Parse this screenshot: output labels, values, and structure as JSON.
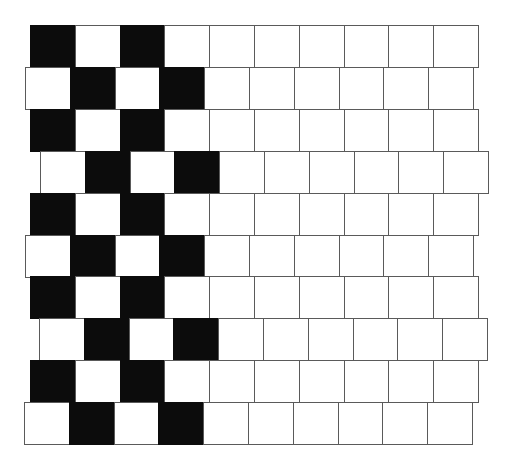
{
  "figure": {
    "name": "Cafe wall illusion pattern",
    "colors": {
      "background": "#ffffff",
      "dark": "#0c0c0c",
      "light": "#ffffff",
      "mortar": "#5a5a5a"
    },
    "cell_width": 44.8,
    "row_height": 41.9,
    "cells_per_row": 10,
    "rows": [
      {
        "y": 25,
        "x": 30,
        "black": [
          0,
          2
        ]
      },
      {
        "y": 67,
        "x": 25,
        "black": [
          1,
          3
        ]
      },
      {
        "y": 109,
        "x": 30,
        "black": [
          0,
          2
        ]
      },
      {
        "y": 151,
        "x": 40,
        "black": [
          1,
          3
        ]
      },
      {
        "y": 193,
        "x": 30,
        "black": [
          0,
          2
        ]
      },
      {
        "y": 235,
        "x": 25,
        "black": [
          1,
          3
        ]
      },
      {
        "y": 276,
        "x": 30,
        "black": [
          0,
          2
        ]
      },
      {
        "y": 318,
        "x": 39,
        "black": [
          1,
          3
        ]
      },
      {
        "y": 360,
        "x": 30,
        "black": [
          0,
          2
        ]
      },
      {
        "y": 402,
        "x": 24,
        "black": [
          1,
          3
        ]
      }
    ]
  }
}
